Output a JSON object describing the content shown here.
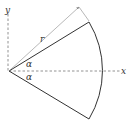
{
  "diagram": {
    "type": "circular-sector",
    "labels": {
      "y_axis": "y",
      "x_axis": "x",
      "radius": "r",
      "angle_upper": "α",
      "angle_lower": "α"
    },
    "colors": {
      "line": "#333333",
      "dashed": "#777777",
      "dimension": "#888888"
    }
  }
}
